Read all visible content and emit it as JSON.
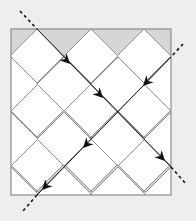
{
  "diagram": {
    "colors": {
      "background": "#eeeeee",
      "frame_fill": "#d6d6d6",
      "frame_stroke": "#8c8c8c",
      "diamond_fill": "#ffffff",
      "grid_stroke": "#8f8f8f",
      "ray_stroke": "#111111"
    },
    "frame": {
      "x": 11,
      "y": 29,
      "width": 160,
      "height": 166
    },
    "grid": {
      "top_vertices_x": [
        37,
        91,
        144
      ],
      "side_vertices_y": [
        57,
        112,
        167
      ],
      "half_diagonal": 27
    },
    "rays": [
      {
        "name": "ray-down-right",
        "dashed_in": [
          [
            20,
            11
          ],
          [
            37,
            29
          ]
        ],
        "solid": [
          [
            37,
            29
          ],
          [
            171,
            167
          ]
        ],
        "dashed_out": [
          [
            171,
            167
          ],
          [
            186,
            184
          ]
        ],
        "arrowheads": [
          [
            70,
            64
          ],
          [
            103,
            98
          ],
          [
            165,
            161
          ]
        ],
        "direction": "down-right"
      },
      {
        "name": "ray-down-left",
        "dashed_in": [
          [
            183,
            44
          ],
          [
            171,
            57
          ]
        ],
        "solid": [
          [
            171,
            57
          ],
          [
            37,
            195
          ]
        ],
        "dashed_out": [
          [
            37,
            195
          ],
          [
            23,
            211
          ]
        ],
        "arrowheads": [
          [
            143,
            86
          ],
          [
            83,
            148
          ],
          [
            42,
            190
          ]
        ],
        "direction": "down-left"
      }
    ]
  }
}
